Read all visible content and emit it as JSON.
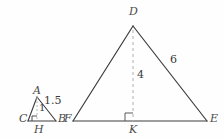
{
  "figure": {
    "type": "geometry-diagram",
    "background_color": "#fefefe",
    "stroke_color": "#3c3c3c",
    "dashed_color": "#b5b5b5",
    "label_color": "#4a4a4a"
  },
  "small_triangle": {
    "name": "triangle-ABC",
    "vertices": {
      "apex": {
        "label": "A",
        "x": 37,
        "y": 97
      },
      "left": {
        "label": "C",
        "x": 28,
        "y": 121
      },
      "right": {
        "label": "B",
        "x": 56,
        "y": 121
      },
      "foot": {
        "label": "H",
        "x": 37,
        "y": 121
      }
    },
    "labels": {
      "apex": "A",
      "left": "C",
      "right": "B",
      "foot": "H"
    },
    "measures": {
      "hypotenuse": "1.5",
      "altitude": "1"
    },
    "right_angle_at": "H"
  },
  "large_triangle": {
    "name": "triangle-DEF",
    "vertices": {
      "apex": {
        "label": "D",
        "x": 133,
        "y": 26
      },
      "left": {
        "label": "F",
        "x": 73,
        "y": 121
      },
      "right": {
        "label": "E",
        "x": 207,
        "y": 121
      },
      "foot": {
        "label": "K",
        "x": 133,
        "y": 121
      }
    },
    "labels": {
      "apex": "D",
      "left": "F",
      "right": "E",
      "foot": "K"
    },
    "measures": {
      "side_DE": "6",
      "altitude_DK": "4"
    },
    "right_angle_at": "K"
  }
}
